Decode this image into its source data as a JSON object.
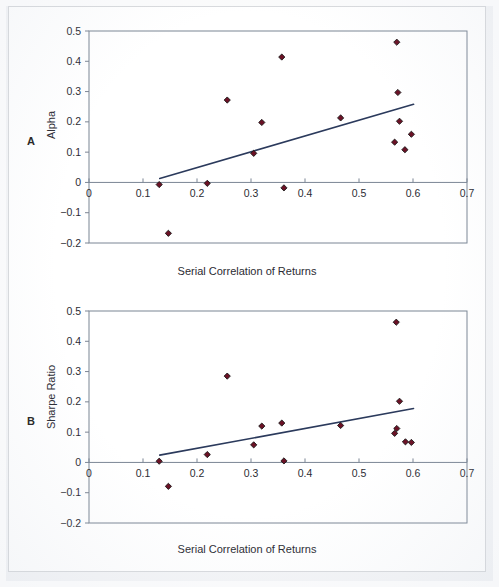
{
  "figure": {
    "panel_letter_a": "A",
    "panel_letter_b": "B",
    "xlabel": "Serial Correlation of Returns",
    "ylabel_a": "Alpha",
    "ylabel_b": "Sharpe Ratio",
    "marker_color": "#6b1125",
    "marker_edge_color": "#1a1a1a",
    "trendline_color": "#2b3a5c",
    "axis_color": "#7b8594",
    "text_color": "#2b2b33"
  },
  "chart_data": [
    {
      "type": "scatter",
      "panel": "A",
      "title": "",
      "xlabel": "Serial Correlation of Returns",
      "ylabel": "Alpha",
      "xlim": [
        0,
        0.7
      ],
      "ylim": [
        -0.2,
        0.5
      ],
      "xticks": [
        0,
        0.1,
        0.2,
        0.3,
        0.4,
        0.5,
        0.6,
        0.7
      ],
      "xtick_labels": [
        "0",
        "0.1",
        "0.2",
        "0.3",
        "0.4",
        "0.5",
        "0.6",
        "0.7"
      ],
      "yticks": [
        -0.2,
        -0.1,
        0,
        0.1,
        0.2,
        0.3,
        0.4,
        0.5
      ],
      "ytick_labels": [
        "-0.2",
        "-0.1",
        "0",
        "0.1",
        "0.2",
        "0.3",
        "0.4",
        "0.5"
      ],
      "grid": false,
      "legend": null,
      "points": [
        {
          "x": 0.13,
          "y": -0.007
        },
        {
          "x": 0.147,
          "y": -0.168
        },
        {
          "x": 0.219,
          "y": -0.003
        },
        {
          "x": 0.256,
          "y": 0.272
        },
        {
          "x": 0.305,
          "y": 0.096
        },
        {
          "x": 0.32,
          "y": 0.198
        },
        {
          "x": 0.357,
          "y": 0.414
        },
        {
          "x": 0.361,
          "y": -0.018
        },
        {
          "x": 0.466,
          "y": 0.213
        },
        {
          "x": 0.566,
          "y": 0.133
        },
        {
          "x": 0.57,
          "y": 0.463
        },
        {
          "x": 0.572,
          "y": 0.297
        },
        {
          "x": 0.575,
          "y": 0.202
        },
        {
          "x": 0.585,
          "y": 0.108
        },
        {
          "x": 0.597,
          "y": 0.159
        }
      ],
      "trendline": {
        "x0": 0.131,
        "y0": 0.013,
        "x1": 0.601,
        "y1": 0.258
      }
    },
    {
      "type": "scatter",
      "panel": "B",
      "title": "",
      "xlabel": "Serial Correlation of Returns",
      "ylabel": "Sharpe Ratio",
      "xlim": [
        0,
        0.7
      ],
      "ylim": [
        -0.2,
        0.5
      ],
      "xticks": [
        0,
        0.1,
        0.2,
        0.3,
        0.4,
        0.5,
        0.6,
        0.7
      ],
      "xtick_labels": [
        "0",
        "0.1",
        "0.2",
        "0.3",
        "0.4",
        "0.5",
        "0.6",
        "0.7"
      ],
      "yticks": [
        -0.2,
        -0.1,
        0,
        0.1,
        0.2,
        0.3,
        0.4,
        0.5
      ],
      "ytick_labels": [
        "-0.2",
        "-0.1",
        "0",
        "0.1",
        "0.2",
        "0.3",
        "0.4",
        "0.5"
      ],
      "grid": false,
      "legend": null,
      "points": [
        {
          "x": 0.13,
          "y": 0.004
        },
        {
          "x": 0.147,
          "y": -0.079
        },
        {
          "x": 0.219,
          "y": 0.026
        },
        {
          "x": 0.256,
          "y": 0.285
        },
        {
          "x": 0.305,
          "y": 0.058
        },
        {
          "x": 0.32,
          "y": 0.12
        },
        {
          "x": 0.357,
          "y": 0.13
        },
        {
          "x": 0.361,
          "y": 0.005
        },
        {
          "x": 0.466,
          "y": 0.122
        },
        {
          "x": 0.566,
          "y": 0.096
        },
        {
          "x": 0.569,
          "y": 0.463
        },
        {
          "x": 0.57,
          "y": 0.112
        },
        {
          "x": 0.575,
          "y": 0.202
        },
        {
          "x": 0.586,
          "y": 0.068
        },
        {
          "x": 0.597,
          "y": 0.066
        }
      ],
      "trendline": {
        "x0": 0.131,
        "y0": 0.024,
        "x1": 0.601,
        "y1": 0.178
      }
    }
  ]
}
